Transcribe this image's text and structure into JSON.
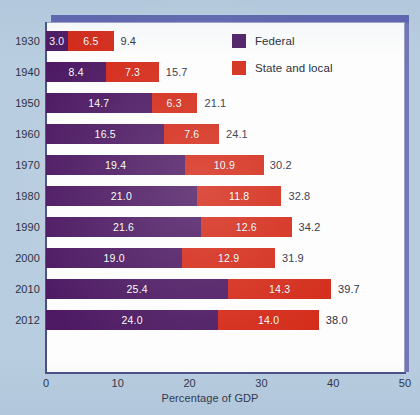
{
  "chart_data": {
    "type": "bar",
    "orientation": "horizontal",
    "stacked": true,
    "title": "",
    "xlabel": "Percentage of GDP",
    "ylabel": "",
    "xlim": [
      0,
      50
    ],
    "xticks": [
      0,
      10,
      20,
      30,
      40,
      50
    ],
    "xtick_labels": [
      "0",
      "10",
      "20",
      "30",
      "40",
      "50"
    ],
    "grid": false,
    "legend_position": "upper-right-inside",
    "categories": [
      "1930",
      "1940",
      "1950",
      "1960",
      "1970",
      "1980",
      "1990",
      "2000",
      "2010",
      "2012"
    ],
    "series": [
      {
        "name": "Federal",
        "color": "#4d1a63",
        "values": [
          3.0,
          8.4,
          14.7,
          16.5,
          19.4,
          21.0,
          21.6,
          19.0,
          25.4,
          24.0
        ],
        "labels": [
          "3.0",
          "8.4",
          "14.7",
          "16.5",
          "19.4",
          "21.0",
          "21.6",
          "19.0",
          "25.4",
          "24.0"
        ]
      },
      {
        "name": "State and local",
        "color": "#d42a18",
        "values": [
          6.5,
          7.3,
          6.3,
          7.6,
          10.9,
          11.8,
          12.6,
          12.9,
          14.3,
          14.0
        ],
        "labels": [
          "6.5",
          "7.3",
          "6.3",
          "7.6",
          "10.9",
          "11.8",
          "12.6",
          "12.9",
          "14.3",
          "14.0"
        ]
      }
    ],
    "totals": [
      9.4,
      15.7,
      21.1,
      24.1,
      30.2,
      32.8,
      34.2,
      31.9,
      39.7,
      38.0
    ],
    "total_labels": [
      "9.4",
      "15.7",
      "21.1",
      "24.1",
      "30.2",
      "32.8",
      "34.2",
      "31.9",
      "39.7",
      "38.0"
    ]
  },
  "legend": {
    "items": [
      {
        "label": "Federal",
        "color": "#4d1a63",
        "swatch": "federal-swatch"
      },
      {
        "label": "State and local",
        "color": "#d42a18",
        "swatch": "state-local-swatch"
      }
    ]
  },
  "axis": {
    "x_title": "Percentage of GDP",
    "ticks": [
      "0",
      "10",
      "20",
      "30",
      "40",
      "50"
    ]
  },
  "colors": {
    "federal": "#4d1a63",
    "state_and_local": "#d42a18",
    "background": "#b9cde0",
    "plot_background": "#fdfdfd",
    "frame": "#6b6fb0",
    "axis": "#4a4f86",
    "text": "#2b3044"
  }
}
